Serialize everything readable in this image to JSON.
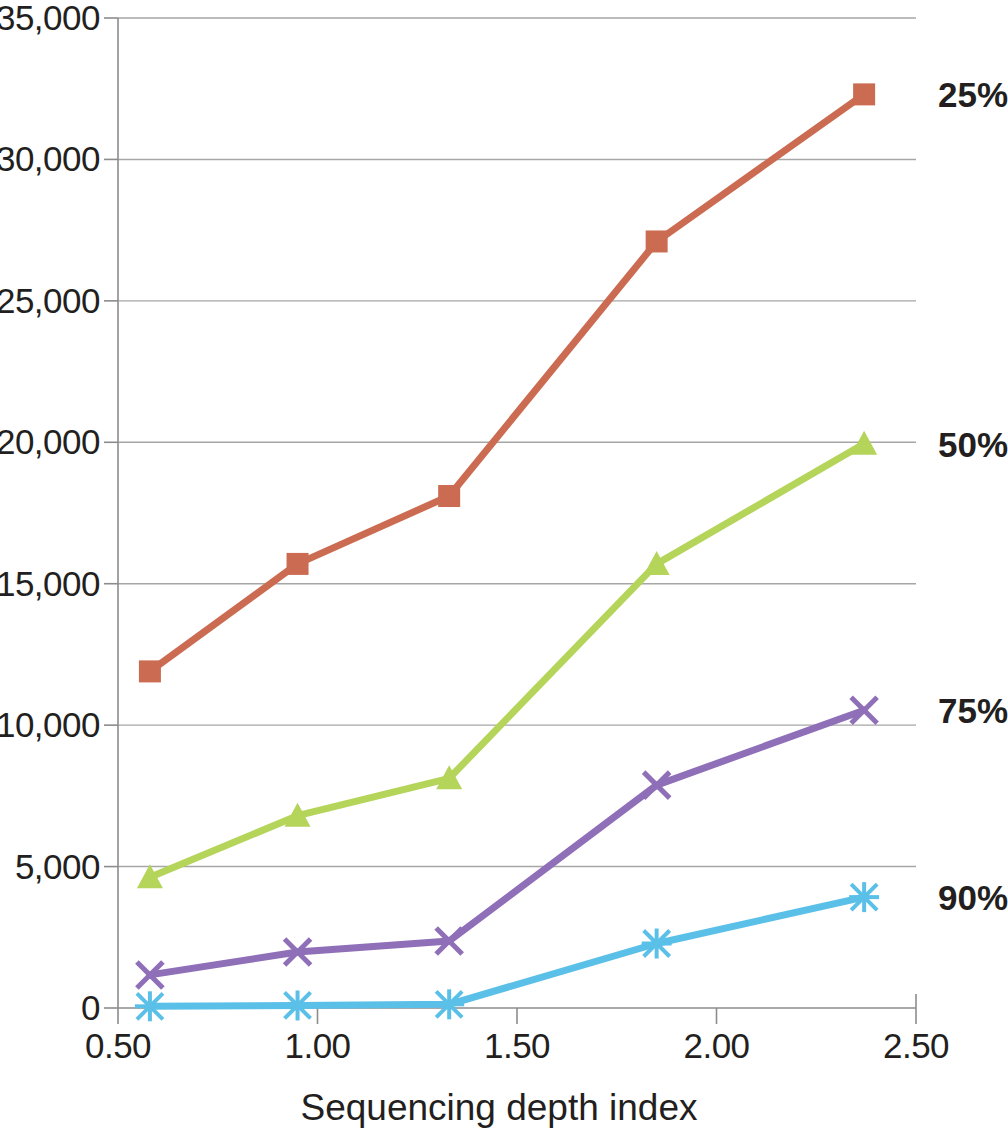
{
  "chart_data": {
    "type": "line",
    "title": "",
    "subtitle": "",
    "xlabel": "Sequencing depth index",
    "ylabel": "",
    "xlim": [
      0.35,
      2.64
    ],
    "ylim": [
      0,
      35000
    ],
    "xticks": [
      "0.50",
      "1.00",
      "1.50",
      "2.00",
      "2.50"
    ],
    "xtick_values": [
      0.5,
      1.0,
      1.5,
      2.0,
      2.5
    ],
    "yticks": [
      "0",
      "5,000",
      "10,000",
      "15,000",
      "20,000",
      "25,000",
      "30,000",
      "35,000"
    ],
    "ytick_values": [
      0,
      5000,
      10000,
      15000,
      20000,
      25000,
      30000,
      35000
    ],
    "grid": "horizontal",
    "legend_position": "right-inline-end-of-line",
    "x": [
      0.58,
      0.95,
      1.33,
      1.85,
      2.37
    ],
    "series": [
      {
        "name": "25%",
        "color": "#CB6C52",
        "marker": "square",
        "values": [
          11900,
          15700,
          18100,
          27100,
          32300
        ],
        "label_y": 32300
      },
      {
        "name": "50%",
        "color": "#B5D45A",
        "marker": "triangle",
        "values": [
          4620,
          6800,
          8120,
          15700,
          19950
        ],
        "label_y": 19950
      },
      {
        "name": "75%",
        "color": "#8E6FB8",
        "marker": "x",
        "values": [
          1170,
          1980,
          2370,
          7880,
          10530
        ],
        "label_y": 10530
      },
      {
        "name": "90%",
        "color": "#5BC0E8",
        "marker": "asterisk",
        "values": [
          60,
          90,
          130,
          2280,
          3920
        ],
        "label_y": 3920
      }
    ],
    "axis_color": "#8c8c8c",
    "grid_color": "#a6a6a6",
    "text_color": "#231f20"
  }
}
